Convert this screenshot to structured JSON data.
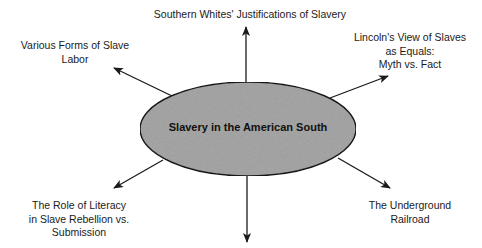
{
  "diagram": {
    "type": "concept-web",
    "center": {
      "label": "Slavery in the American South",
      "fill": "#a9a9a9",
      "stroke": "#1a1a1a"
    },
    "nodes": [
      {
        "id": "top",
        "lines": [
          "Southern Whites' Justifications of Slavery"
        ]
      },
      {
        "id": "upper-left",
        "lines": [
          "Various Forms of Slave",
          "Labor"
        ]
      },
      {
        "id": "upper-right",
        "lines": [
          "Lincoln's View of Slaves",
          "as Equals:",
          "Myth vs. Fact"
        ]
      },
      {
        "id": "lower-left",
        "lines": [
          "The Role of Literacy",
          "in Slave Rebellion vs.",
          "Submission"
        ]
      },
      {
        "id": "lower-right",
        "lines": [
          "The Underground",
          "Railroad"
        ]
      },
      {
        "id": "bottom",
        "lines": []
      }
    ],
    "edge_color": "#1a1a1a"
  }
}
